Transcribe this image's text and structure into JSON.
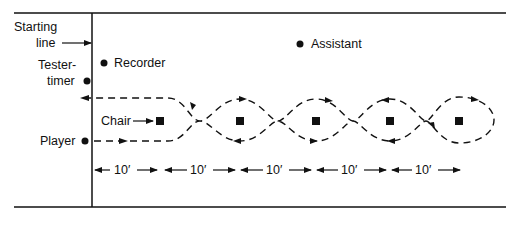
{
  "diagram": {
    "type": "field-layout",
    "labels": {
      "starting_line_1": "Starting",
      "starting_line_2": "line",
      "tester_timer_1": "Tester-",
      "tester_timer_2": "timer",
      "recorder": "Recorder",
      "assistant": "Assistant",
      "chair": "Chair",
      "player": "Player"
    },
    "chairs": 5,
    "distances": [
      "10′",
      "10′",
      "10′",
      "10′",
      "10′"
    ],
    "colors": {
      "ink": "#111111",
      "background": "#ffffff"
    }
  }
}
